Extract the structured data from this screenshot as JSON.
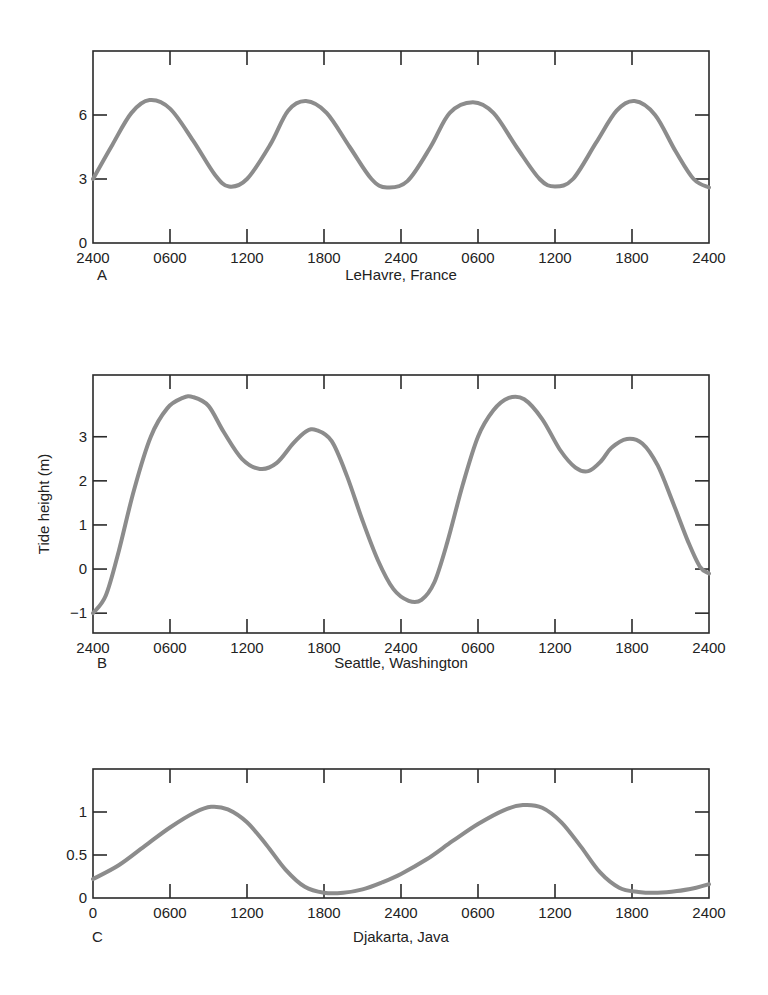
{
  "figure": {
    "ylabel_shared": "Tide height (m)"
  },
  "chart_data": [
    {
      "type": "line",
      "panel": "A",
      "title": "LeHavre, France",
      "xlabel": "",
      "ylabel": "Tide height (m)",
      "x_tick_labels": [
        "2400",
        "0600",
        "1200",
        "1800",
        "2400",
        "0600",
        "1200",
        "1800",
        "2400"
      ],
      "y_ticks": [
        0,
        3,
        6
      ],
      "y_tick_labels": [
        "0",
        "3",
        "6"
      ],
      "ylim": [
        0,
        9
      ],
      "xlim_hours": [
        0,
        48
      ],
      "grid": false,
      "series": [
        {
          "name": "LeHavre, France",
          "x_hours": [
            0,
            1.5,
            3.0,
            4.4,
            6.0,
            7.8,
            9.5,
            10.6,
            12.0,
            13.8,
            15.2,
            16.6,
            18.2,
            20.0,
            21.7,
            22.9,
            24.5,
            26.3,
            27.8,
            29.6,
            31.2,
            33.0,
            34.8,
            36.0,
            37.4,
            39.2,
            40.8,
            42.2,
            43.8,
            45.4,
            46.8,
            48.0
          ],
          "values": [
            3.0,
            4.6,
            6.1,
            6.7,
            6.3,
            4.8,
            3.2,
            2.65,
            3.0,
            4.6,
            6.2,
            6.65,
            6.1,
            4.5,
            3.0,
            2.6,
            2.9,
            4.5,
            6.1,
            6.6,
            6.1,
            4.5,
            3.0,
            2.65,
            3.0,
            4.7,
            6.2,
            6.65,
            6.0,
            4.3,
            3.0,
            2.6
          ]
        }
      ]
    },
    {
      "type": "line",
      "panel": "B",
      "title": "Seattle, Washington",
      "xlabel": "",
      "ylabel": "Tide height (m)",
      "x_tick_labels": [
        "2400",
        "0600",
        "1200",
        "1800",
        "2400",
        "0600",
        "1200",
        "1800",
        "2400"
      ],
      "y_ticks": [
        -1,
        0,
        1,
        2,
        3
      ],
      "y_tick_labels": [
        "−1",
        "0",
        "1",
        "2",
        "3"
      ],
      "ylim": [
        -1.45,
        4.4
      ],
      "xlim_hours": [
        0,
        48
      ],
      "grid": false,
      "series": [
        {
          "name": "Seattle, Washington",
          "x_hours": [
            0,
            1.0,
            2.0,
            3.2,
            4.5,
            5.8,
            7.0,
            7.8,
            9.0,
            10.2,
            11.6,
            13.0,
            14.3,
            15.6,
            16.6,
            17.4,
            18.6,
            19.8,
            21.0,
            22.2,
            23.4,
            24.6,
            25.6,
            26.6,
            27.6,
            28.8,
            30.0,
            31.2,
            32.4,
            33.6,
            35.0,
            36.4,
            37.6,
            38.6,
            39.6,
            40.4,
            41.6,
            42.8,
            44.0,
            45.2,
            46.4,
            47.3,
            48.0
          ],
          "values": [
            -1.0,
            -0.6,
            0.4,
            1.8,
            3.0,
            3.65,
            3.88,
            3.9,
            3.7,
            3.1,
            2.5,
            2.27,
            2.4,
            2.85,
            3.12,
            3.15,
            2.9,
            2.1,
            1.1,
            0.2,
            -0.45,
            -0.72,
            -0.7,
            -0.3,
            0.6,
            1.9,
            3.0,
            3.6,
            3.88,
            3.85,
            3.4,
            2.7,
            2.3,
            2.22,
            2.45,
            2.75,
            2.95,
            2.85,
            2.35,
            1.5,
            0.6,
            0.05,
            -0.1
          ]
        }
      ]
    },
    {
      "type": "line",
      "panel": "C",
      "title": "Djakarta, Java",
      "xlabel": "",
      "ylabel": "Tide height (m)",
      "x_tick_labels": [
        "0",
        "0600",
        "1200",
        "1800",
        "2400",
        "0600",
        "1200",
        "1800",
        "2400"
      ],
      "y_ticks": [
        0,
        0.5,
        1
      ],
      "y_tick_labels": [
        "0",
        "0.5",
        "1"
      ],
      "ylim": [
        0,
        1.5
      ],
      "xlim_hours": [
        0,
        48
      ],
      "grid": false,
      "series": [
        {
          "name": "Djakarta, Java",
          "x_hours": [
            0,
            2.0,
            4.0,
            6.0,
            8.0,
            9.2,
            10.5,
            12.0,
            13.5,
            15.0,
            16.5,
            18.0,
            19.5,
            21.0,
            22.5,
            24.0,
            26.0,
            28.0,
            30.0,
            32.0,
            33.5,
            35.0,
            36.5,
            38.0,
            39.5,
            41.0,
            42.5,
            44.0,
            45.5,
            47.0,
            48.0
          ],
          "values": [
            0.22,
            0.38,
            0.6,
            0.82,
            1.0,
            1.06,
            1.03,
            0.88,
            0.62,
            0.33,
            0.13,
            0.06,
            0.06,
            0.1,
            0.18,
            0.28,
            0.45,
            0.66,
            0.86,
            1.02,
            1.08,
            1.05,
            0.88,
            0.6,
            0.3,
            0.12,
            0.07,
            0.06,
            0.08,
            0.12,
            0.16
          ]
        }
      ]
    }
  ]
}
